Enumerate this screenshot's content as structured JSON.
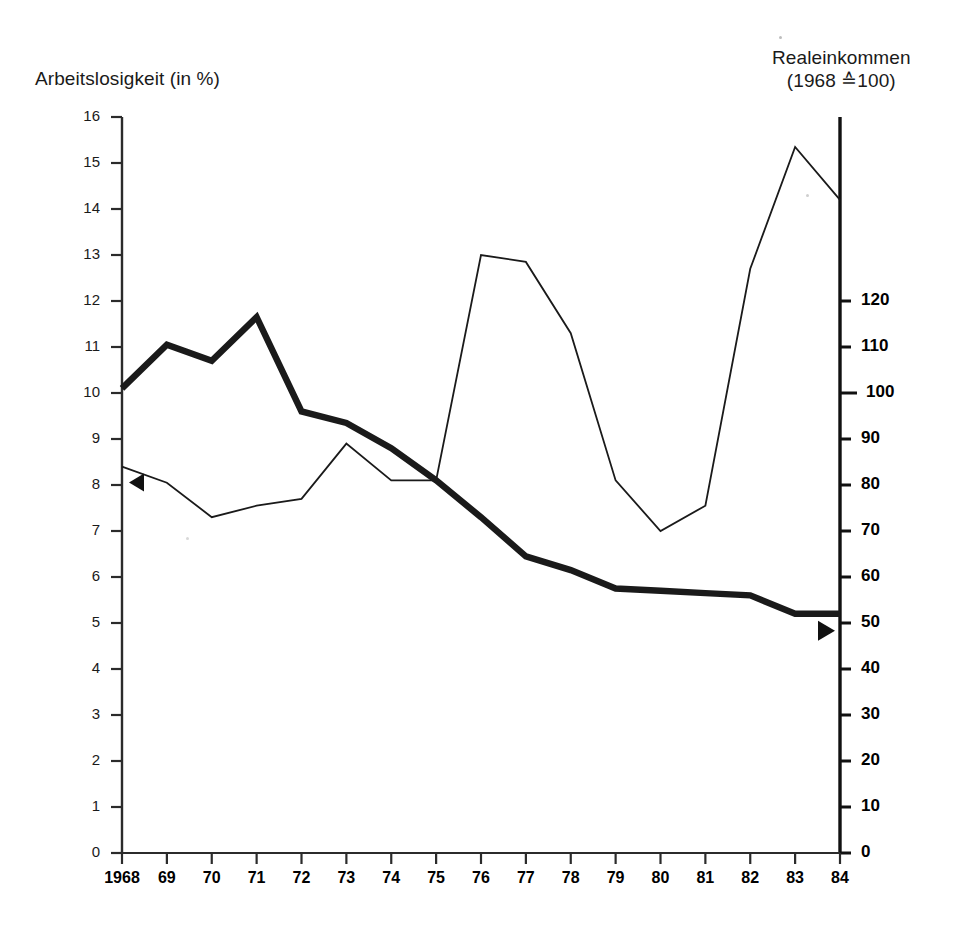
{
  "figure": {
    "left_axis_title": "Arbeitslosigkeit (in %)",
    "right_axis_title_line1": "Realeinkommen",
    "right_axis_title_line2": "(1968 ≙100)"
  },
  "chart_data": {
    "type": "line",
    "title": "",
    "xlabel": "",
    "ylabel": "Arbeitslosigkeit (in %)",
    "y2label": "Realeinkommen (1968 ≙100)",
    "grid": false,
    "legend": "none",
    "x": [
      "1968",
      "69",
      "70",
      "71",
      "72",
      "73",
      "74",
      "75",
      "76",
      "77",
      "78",
      "79",
      "80",
      "81",
      "82",
      "83",
      "84"
    ],
    "xtick_labels": [
      "1968",
      "69",
      "70",
      "71",
      "72",
      "73",
      "74",
      "75",
      "76",
      "77",
      "78",
      "79",
      "80",
      "81",
      "82",
      "83",
      "84"
    ],
    "ylim": [
      0,
      16
    ],
    "ytick_labels": [
      "0",
      "1",
      "2",
      "3",
      "4",
      "5",
      "6",
      "7",
      "8",
      "9",
      "10",
      "11",
      "12",
      "13",
      "14",
      "15",
      "16"
    ],
    "ytick_values": [
      0,
      1,
      2,
      3,
      4,
      5,
      6,
      7,
      8,
      9,
      10,
      11,
      12,
      13,
      14,
      15,
      16
    ],
    "y2lim": [
      0,
      160
    ],
    "y2tick_labels": [
      "0",
      "10",
      "20",
      "30",
      "40",
      "50",
      "60",
      "70",
      "80",
      "90",
      "100",
      "110",
      "120"
    ],
    "y2tick_values": [
      0,
      10,
      20,
      30,
      40,
      50,
      60,
      70,
      80,
      90,
      100,
      110,
      120
    ],
    "series": [
      {
        "name": "Arbeitslosigkeit (in %)",
        "axis": "left",
        "style": "thick",
        "color": "#1a1a1a",
        "marker_end": "right-triangle",
        "values": [
          10.1,
          11.05,
          10.7,
          11.65,
          9.6,
          9.35,
          8.8,
          8.1,
          7.3,
          6.45,
          6.15,
          5.75,
          5.7,
          5.65,
          5.6,
          5.2,
          5.2
        ]
      },
      {
        "name": "Realeinkommen (1968 ≙100)",
        "axis": "right",
        "style": "thin",
        "color": "#1a1a1a",
        "marker_start": "left-triangle",
        "values_left_scale": [
          8.4,
          8.05,
          7.3,
          7.55,
          7.7,
          8.9,
          8.1,
          8.1,
          13.0,
          12.85,
          11.3,
          8.1,
          7.0,
          7.55,
          12.7,
          15.35,
          14.2
        ],
        "values": [
          84,
          80.5,
          73,
          75.5,
          77,
          89,
          81,
          81,
          130,
          128.5,
          113,
          81,
          70,
          75.5,
          127,
          153.5,
          142
        ]
      }
    ]
  }
}
